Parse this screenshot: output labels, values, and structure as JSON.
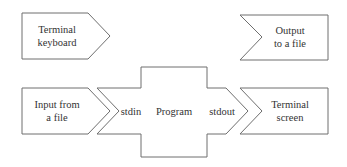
{
  "diagram": {
    "type": "io-redirection-flow",
    "nodes": {
      "terminal_keyboard": {
        "line1": "Terminal",
        "line2": "keyboard"
      },
      "output_file": {
        "line1": "Output",
        "line2": "to a file"
      },
      "input_file": {
        "line1": "Input from",
        "line2": "a file"
      },
      "program": {
        "label": "Program",
        "stdin": "stdin",
        "stdout": "stdout"
      },
      "terminal_screen": {
        "line1": "Terminal",
        "line2": "screen"
      }
    },
    "colors": {
      "stroke": "#6e6e6e",
      "fill": "#ffffff",
      "text": "#333333"
    }
  }
}
